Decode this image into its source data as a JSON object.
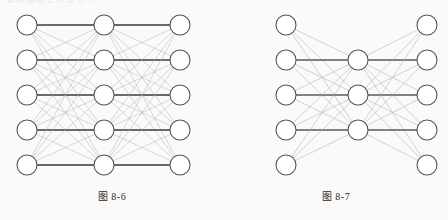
{
  "page": {
    "background_color": "#fbfaf8",
    "header_text_partial": "神经网络与深度学习",
    "width": 448,
    "height": 220
  },
  "figures": [
    {
      "id": "figure-left",
      "caption": "图 8-6",
      "caption_label": "图",
      "caption_number": "8-6",
      "diagram_type": "neural-network",
      "layers": [
        {
          "name": "input-layer",
          "node_count": 5,
          "x": 27,
          "node_y": [
            25,
            60,
            95,
            130,
            165
          ]
        },
        {
          "name": "hidden-layer",
          "node_count": 5,
          "x": 104,
          "node_y": [
            25,
            60,
            95,
            130,
            165
          ]
        },
        {
          "name": "output-layer",
          "node_count": 5,
          "x": 180,
          "node_y": [
            25,
            60,
            95,
            130,
            165
          ]
        }
      ],
      "node_radius": 10,
      "node_fill": "#ffffff",
      "node_stroke": "#555555",
      "edge_color_light": "#b9b9b9",
      "edge_color_dark": "#3a3a3a",
      "fully_connected": true,
      "horizontal_edges_emphasized": true
    },
    {
      "id": "figure-right",
      "caption": "图 8-7",
      "caption_label": "图",
      "caption_number": "8-7",
      "diagram_type": "neural-network",
      "layers": [
        {
          "name": "input-layer",
          "node_count": 5,
          "x": 62,
          "node_y": [
            25,
            60,
            95,
            130,
            165
          ]
        },
        {
          "name": "hidden-layer",
          "node_count": 3,
          "x": 134,
          "node_y": [
            60,
            95,
            130
          ]
        },
        {
          "name": "output-layer",
          "node_count": 5,
          "x": 203,
          "node_y": [
            25,
            60,
            95,
            130,
            165
          ]
        }
      ],
      "node_radius": 10,
      "node_fill": "#ffffff",
      "node_stroke": "#555555",
      "edge_color_light": "#b0b0b0",
      "edge_color_dark": "#5a5a5a",
      "fully_connected": true,
      "horizontal_edges_emphasized": true
    }
  ]
}
